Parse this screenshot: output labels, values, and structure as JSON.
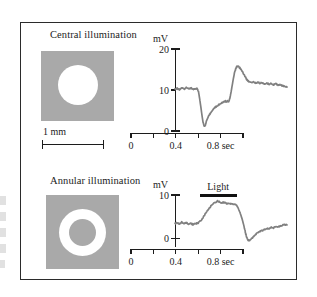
{
  "figure": {
    "background_color": "#ffffff",
    "border_color": "#2b2b2b",
    "stimulus_gray": "#a9a9a9",
    "trace_color": "#808080",
    "scalebar": {
      "label": "1 mm"
    }
  },
  "panels": [
    {
      "id": "central",
      "title": "Central illumination",
      "stimulus_icon": "filled-disc-on-gray-square",
      "y_unit": "mV"
    },
    {
      "id": "annular",
      "title": "Annular illumination",
      "stimulus_icon": "annulus-ring-on-gray-square",
      "y_unit": "mV",
      "stimulus_marker_label": "Light"
    }
  ],
  "chart_data": [
    {
      "type": "line",
      "id": "central-illumination-response",
      "title": "Central illumination",
      "xlabel": "sec",
      "ylabel": "mV",
      "xlim": [
        0,
        1.0
      ],
      "ylim": [
        0,
        20
      ],
      "grid": false,
      "legend": null,
      "x_ticks": [
        0,
        0.2,
        0.4,
        0.6,
        0.8,
        1.0
      ],
      "x_tick_labels": [
        "0",
        "",
        "0.4",
        "",
        "0.8 sec",
        ""
      ],
      "y_ticks": [
        0,
        10,
        20
      ],
      "y_tick_labels": [
        "0",
        "10",
        "20"
      ],
      "series": [
        {
          "name": "membrane potential",
          "color": "#808080",
          "x": [
            0.0,
            0.02,
            0.04,
            0.06,
            0.08,
            0.1,
            0.12,
            0.14,
            0.16,
            0.18,
            0.2,
            0.21,
            0.22,
            0.23,
            0.24,
            0.25,
            0.26,
            0.27,
            0.28,
            0.3,
            0.32,
            0.34,
            0.36,
            0.38,
            0.4,
            0.42,
            0.44,
            0.45,
            0.46,
            0.47,
            0.48,
            0.49,
            0.5,
            0.51,
            0.52,
            0.53,
            0.54,
            0.55,
            0.56,
            0.58,
            0.6,
            0.62,
            0.64,
            0.66,
            0.68,
            0.7,
            0.72,
            0.74,
            0.76,
            0.78,
            0.8,
            0.82,
            0.84,
            0.86,
            0.88,
            0.9,
            0.92,
            0.94,
            0.96,
            0.98,
            1.0
          ],
          "y": [
            10.2,
            10.4,
            10.1,
            10.5,
            10.2,
            10.6,
            10.3,
            10.5,
            10.2,
            10.4,
            10.3,
            9.6,
            7.9,
            6.0,
            4.0,
            2.2,
            1.2,
            1.4,
            2.4,
            3.6,
            4.5,
            5.2,
            5.8,
            6.2,
            6.6,
            6.9,
            7.1,
            7.3,
            7.0,
            7.3,
            7.2,
            8.0,
            9.4,
            11.0,
            12.6,
            14.0,
            15.0,
            15.6,
            15.8,
            15.4,
            14.6,
            13.6,
            12.6,
            12.0,
            11.8,
            12.0,
            11.7,
            11.9,
            11.6,
            11.8,
            11.5,
            11.7,
            11.4,
            11.6,
            11.3,
            11.5,
            11.2,
            11.3,
            11.0,
            10.9,
            10.7
          ]
        }
      ]
    },
    {
      "type": "line",
      "id": "annular-illumination-response",
      "title": "Annular illumination",
      "xlabel": "sec",
      "ylabel": "mV",
      "xlim": [
        0,
        1.0
      ],
      "ylim": [
        -2,
        10
      ],
      "grid": false,
      "legend": null,
      "x_ticks": [
        0,
        0.2,
        0.4,
        0.6,
        0.8,
        1.0
      ],
      "x_tick_labels": [
        "0",
        "",
        "0.4",
        "",
        "0.8 sec",
        ""
      ],
      "y_ticks": [
        0,
        10
      ],
      "y_tick_labels": [
        "0",
        "10"
      ],
      "stimulus_bar": {
        "label": "Light",
        "start": 0.22,
        "end": 0.55,
        "color": "#111111"
      },
      "series": [
        {
          "name": "membrane potential",
          "color": "#808080",
          "x": [
            0.0,
            0.02,
            0.04,
            0.06,
            0.08,
            0.1,
            0.12,
            0.14,
            0.16,
            0.18,
            0.2,
            0.22,
            0.24,
            0.26,
            0.28,
            0.3,
            0.32,
            0.34,
            0.36,
            0.38,
            0.4,
            0.42,
            0.44,
            0.46,
            0.48,
            0.5,
            0.52,
            0.54,
            0.56,
            0.58,
            0.6,
            0.62,
            0.63,
            0.64,
            0.65,
            0.66,
            0.68,
            0.7,
            0.72,
            0.74,
            0.76,
            0.78,
            0.8,
            0.82,
            0.84,
            0.86,
            0.88,
            0.9,
            0.92,
            0.94,
            0.96,
            0.98,
            1.0
          ],
          "y": [
            3.4,
            3.6,
            3.3,
            3.7,
            3.4,
            3.6,
            3.3,
            3.5,
            3.2,
            3.4,
            3.5,
            3.8,
            4.4,
            5.2,
            6.0,
            6.8,
            7.4,
            7.9,
            8.3,
            8.6,
            8.4,
            8.2,
            8.3,
            8.0,
            8.1,
            7.9,
            7.8,
            7.9,
            7.2,
            6.0,
            4.4,
            2.4,
            1.2,
            0.3,
            -0.3,
            -0.5,
            -0.2,
            0.4,
            0.9,
            1.3,
            1.6,
            1.8,
            2.0,
            2.3,
            2.2,
            2.5,
            2.4,
            2.7,
            2.6,
            2.9,
            3.0,
            3.2,
            3.1
          ]
        }
      ]
    }
  ]
}
